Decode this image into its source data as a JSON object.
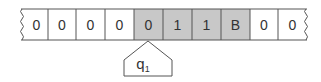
{
  "diagram": {
    "type": "turing-machine-tape",
    "tape": {
      "cells": [
        {
          "symbol": "0",
          "highlighted": false
        },
        {
          "symbol": "0",
          "highlighted": false
        },
        {
          "symbol": "0",
          "highlighted": false
        },
        {
          "symbol": "0",
          "highlighted": false
        },
        {
          "symbol": "0",
          "highlighted": true
        },
        {
          "symbol": "1",
          "highlighted": true
        },
        {
          "symbol": "1",
          "highlighted": true
        },
        {
          "symbol": "B",
          "highlighted": true
        },
        {
          "symbol": "0",
          "highlighted": false
        },
        {
          "symbol": "0",
          "highlighted": false
        }
      ],
      "left_edge": "torn",
      "right_edge": "torn"
    },
    "head": {
      "state": "q",
      "state_subscript": "1",
      "position_index": 4
    },
    "colors": {
      "highlight_fill": "#c8c8c8",
      "cell_fill": "#ffffff",
      "border": "#555555",
      "text": "#333333"
    }
  }
}
